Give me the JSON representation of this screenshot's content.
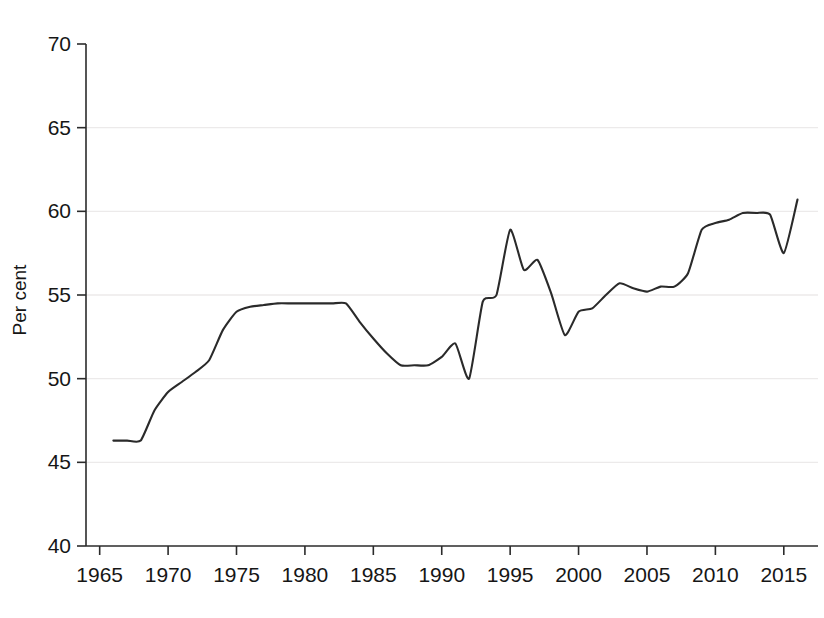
{
  "chart_data": {
    "type": "line",
    "title": "",
    "subtitle": "",
    "xlabel": "",
    "ylabel": "Per cent",
    "xlim": [
      1964.0,
      1817.0
    ],
    "ylim": [
      40,
      70
    ],
    "xlim_years": [
      1964.0,
      2017.5
    ],
    "grid": true,
    "gridlines_y": [
      45,
      50,
      55,
      60,
      65
    ],
    "legend": "none",
    "legend_position": "none",
    "x_ticks": [
      1965,
      1970,
      1975,
      1980,
      1985,
      1990,
      1995,
      2000,
      2005,
      2010,
      2015
    ],
    "x_tick_labels": [
      "1965",
      "1970",
      "1975",
      "1980",
      "1985",
      "1990",
      "1995",
      "2000",
      "2005",
      "2010",
      "2015"
    ],
    "y_ticks": [
      40,
      45,
      50,
      55,
      60,
      65,
      70
    ],
    "y_tick_labels": [
      "40",
      "45",
      "50",
      "55",
      "60",
      "65",
      "70"
    ],
    "line_color": "#2a2a2a",
    "series": [
      {
        "name": "Per cent",
        "x": [
          1966,
          1967,
          1968,
          1969,
          1970,
          1971,
          1972,
          1973,
          1974,
          1975,
          1976,
          1977,
          1978,
          1979,
          1980,
          1981,
          1982,
          1983,
          1984,
          1985,
          1986,
          1987,
          1988,
          1989,
          1990,
          1991,
          1992,
          1993,
          1994,
          1995,
          1996,
          1997,
          1998,
          1999,
          2000,
          2001,
          2002,
          2003,
          2004,
          2005,
          2006,
          2007,
          2008,
          2009,
          2010,
          2011,
          2012,
          2013,
          2014,
          2015,
          2016
        ],
        "values": [
          46.3,
          46.3,
          46.3,
          48.1,
          49.2,
          49.8,
          50.4,
          51.1,
          52.9,
          54.0,
          54.3,
          54.4,
          54.5,
          54.5,
          54.5,
          54.5,
          54.5,
          54.5,
          53.4,
          52.4,
          51.5,
          50.8,
          50.8,
          50.8,
          51.3,
          52.1,
          50.0,
          54.6,
          55.0,
          58.9,
          56.5,
          57.1,
          55.1,
          52.6,
          54.0,
          54.2,
          55.0,
          55.7,
          55.4,
          55.2,
          55.5,
          55.5,
          56.3,
          58.9,
          59.3,
          59.5,
          59.9,
          59.9,
          59.8,
          57.5,
          60.7
        ]
      }
    ]
  },
  "axes": {
    "y_axis_title": "Per cent"
  }
}
